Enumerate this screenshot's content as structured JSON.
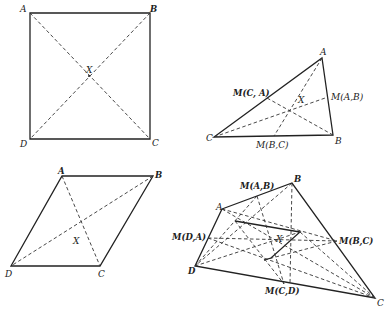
{
  "figures": [
    {
      "name": "square",
      "vertices": {
        "A": [
          30,
          13
        ],
        "B": [
          150,
          13
        ],
        "C": [
          150,
          139
        ],
        "D": [
          30,
          139
        ]
      },
      "center": {
        "label": "X",
        "pos": [
          89,
          76
        ]
      },
      "labels": {
        "A": "A",
        "B": "B",
        "C": "C",
        "D": "D",
        "X": "X"
      }
    },
    {
      "name": "triangle",
      "vertices": {
        "A": [
          322,
          58
        ],
        "B": [
          333,
          135
        ],
        "C": [
          214,
          137
        ]
      },
      "midpoints": {
        "CA": [
          267,
          98
        ],
        "AB": [
          328,
          97
        ],
        "BC": [
          274,
          136
        ]
      },
      "center": {
        "label": "X",
        "pos": [
          289,
          119
        ]
      },
      "labels": {
        "A": "A",
        "B": "B",
        "C": "C",
        "X": "X",
        "MCA": "M(C, A)",
        "MAB": "M(A,B)",
        "MBC": "M(B,C)"
      }
    },
    {
      "name": "parallelogram",
      "vertices": {
        "A": [
          62,
          176
        ],
        "B": [
          153,
          176
        ],
        "C": [
          100,
          266
        ],
        "D": [
          11,
          266
        ]
      },
      "center": {
        "label": "X",
        "pos": [
          82,
          241
        ]
      },
      "labels": {
        "A": "A",
        "B": "B",
        "C": "C",
        "D": "D",
        "X": "X"
      }
    },
    {
      "name": "quadrilateral",
      "vertices": {
        "A": [
          222,
          209
        ],
        "B": [
          292,
          183
        ],
        "C": [
          375,
          298
        ],
        "D": [
          195,
          266
        ]
      },
      "midpoints": {
        "AB": [
          257,
          196
        ],
        "BC": [
          337,
          241
        ],
        "CD": [
          284,
          284
        ],
        "DA": [
          208,
          238
        ]
      },
      "center": {
        "label": "X",
        "pos": [
          283,
          247
        ]
      },
      "labels": {
        "A": "A",
        "B": "B",
        "C": "C",
        "D": "D",
        "X": "X",
        "MAB": "M(A,B)",
        "MBC": "M(B,C)",
        "MCD": "M(C,D)",
        "MDA": "M(D,A)"
      }
    }
  ]
}
